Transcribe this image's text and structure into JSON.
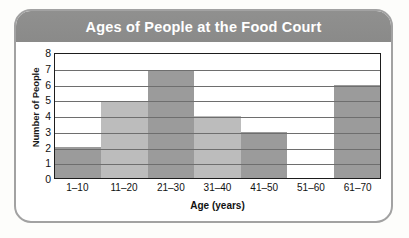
{
  "card": {
    "border_color": "#a2a2a2",
    "background_color": "#ffffff"
  },
  "header": {
    "title": "Ages of People at the Food Court",
    "background_color": "#8d8d8d",
    "text_color": "#ffffff"
  },
  "chart_data": {
    "type": "bar",
    "title": "Ages of People at the Food Court",
    "xlabel": "Age (years)",
    "ylabel": "Number of People",
    "categories": [
      "1–10",
      "11–20",
      "21–30",
      "31–40",
      "41–50",
      "51–60",
      "61–70"
    ],
    "values": [
      2,
      5,
      7,
      4,
      3,
      0,
      6
    ],
    "yticks": [
      8,
      7,
      6,
      5,
      4,
      3,
      2,
      1,
      0
    ],
    "ylim": [
      0,
      8
    ],
    "grid": true,
    "legend": false,
    "bar_gap": 0,
    "bar_colors": [
      "#9b9b9b",
      "#bcbcbc",
      "#9b9b9b",
      "#bcbcbc",
      "#9b9b9b",
      "#bcbcbc",
      "#9b9b9b"
    ]
  }
}
